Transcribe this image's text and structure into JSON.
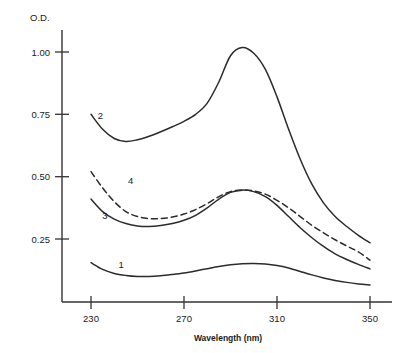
{
  "chart_data": {
    "type": "line",
    "title": "",
    "xlabel": "Wavelength (nm)",
    "ylabel": "O.D.",
    "xlim": [
      230,
      350
    ],
    "ylim": [
      0,
      1.08
    ],
    "xticks": [
      230,
      270,
      310,
      350
    ],
    "yticks": [
      0.25,
      0.5,
      0.75,
      1.0
    ],
    "xtick_labels": [
      "230",
      "270",
      "310",
      "350"
    ],
    "ytick_labels": [
      "0.25",
      "0.50",
      "0.75",
      "1.00"
    ],
    "grid": false,
    "legend_position": "inline-curve-labels",
    "x": [
      230,
      235,
      240,
      245,
      250,
      255,
      260,
      265,
      270,
      275,
      280,
      285,
      290,
      295,
      300,
      305,
      310,
      315,
      320,
      325,
      330,
      335,
      340,
      345,
      350
    ],
    "series": [
      {
        "name": "1",
        "label": "1",
        "style": "solid",
        "label_x": 243,
        "label_y": 0.135,
        "values": [
          0.155,
          0.128,
          0.112,
          0.104,
          0.1,
          0.1,
          0.103,
          0.108,
          0.114,
          0.122,
          0.131,
          0.14,
          0.147,
          0.151,
          0.152,
          0.15,
          0.144,
          0.134,
          0.12,
          0.106,
          0.094,
          0.084,
          0.076,
          0.07,
          0.066
        ]
      },
      {
        "name": "2",
        "label": "2",
        "style": "solid",
        "label_x": 234,
        "label_y": 0.73,
        "values": [
          0.75,
          0.69,
          0.653,
          0.641,
          0.648,
          0.662,
          0.68,
          0.7,
          0.722,
          0.75,
          0.795,
          0.88,
          0.985,
          1.018,
          0.995,
          0.93,
          0.82,
          0.69,
          0.57,
          0.47,
          0.395,
          0.34,
          0.3,
          0.265,
          0.235
        ]
      },
      {
        "name": "3",
        "label": "3",
        "style": "solid",
        "label_x": 236,
        "label_y": 0.33,
        "values": [
          0.41,
          0.36,
          0.33,
          0.312,
          0.302,
          0.3,
          0.304,
          0.312,
          0.325,
          0.345,
          0.375,
          0.41,
          0.437,
          0.446,
          0.44,
          0.42,
          0.385,
          0.34,
          0.295,
          0.255,
          0.22,
          0.19,
          0.168,
          0.148,
          0.13
        ]
      },
      {
        "name": "4",
        "label": "4",
        "style": "dashed",
        "label_x": 247,
        "label_y": 0.47,
        "values": [
          0.52,
          0.455,
          0.4,
          0.36,
          0.34,
          0.332,
          0.332,
          0.338,
          0.35,
          0.368,
          0.392,
          0.42,
          0.44,
          0.447,
          0.443,
          0.43,
          0.405,
          0.375,
          0.34,
          0.305,
          0.275,
          0.247,
          0.222,
          0.198,
          0.165
        ]
      }
    ]
  },
  "plot_geometry": {
    "left_px": 62,
    "right_px": 388,
    "top_px": 30,
    "bottom_px": 302,
    "x0_px": 91,
    "x1_px": 370,
    "y_at_025_px": 239,
    "y_at_100_px": 52
  }
}
